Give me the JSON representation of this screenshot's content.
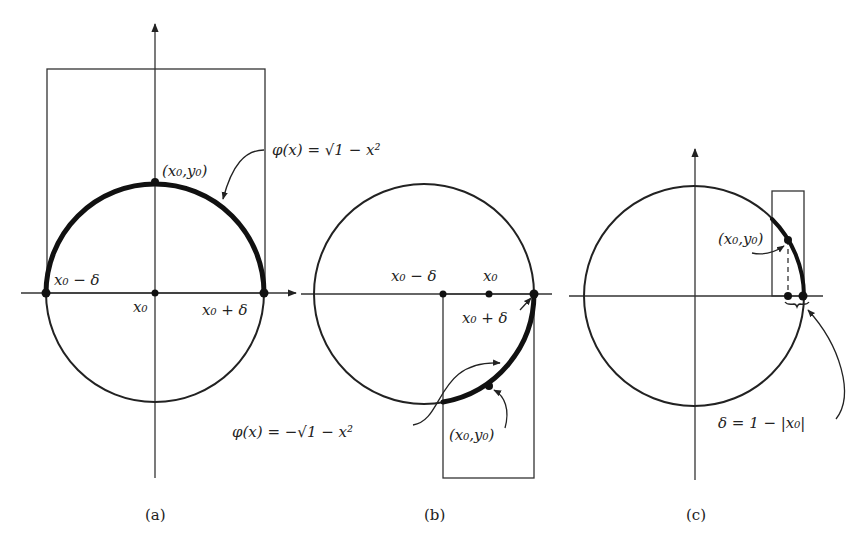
{
  "figure": {
    "panels": [
      {
        "id": "a",
        "caption": "(a)",
        "label_point": "(x₀,y₀)",
        "label_left": "x₀ − δ",
        "label_center": "x₀",
        "label_right": "x₀ + δ",
        "formula": "φ(x) = √1 − x²"
      },
      {
        "id": "b",
        "caption": "(b)",
        "label_left": "x₀ − δ",
        "label_center": "x₀",
        "label_right": "x₀ + δ",
        "label_point": "(x₀,y₀)",
        "formula": "φ(x) = −√1 − x²"
      },
      {
        "id": "c",
        "caption": "(c)",
        "label_point": "(x₀,y₀)",
        "formula": "δ = 1 − |x₀|"
      }
    ]
  }
}
